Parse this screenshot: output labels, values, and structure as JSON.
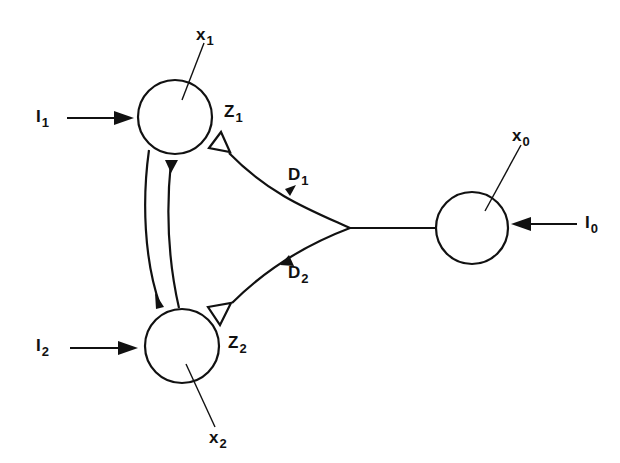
{
  "diagram": {
    "stroke_color": "#111111",
    "background": "#ffffff",
    "nodes": [
      {
        "id": "x1",
        "label": "x",
        "sub": "1",
        "cx": 175,
        "cy": 117,
        "r": 37
      },
      {
        "id": "x2",
        "label": "x",
        "sub": "2",
        "cx": 182,
        "cy": 346,
        "r": 37
      },
      {
        "id": "x0",
        "label": "x",
        "sub": "0",
        "cx": 472,
        "cy": 228,
        "r": 36
      }
    ],
    "inputs": [
      {
        "id": "I1",
        "label": "I",
        "sub": "1",
        "target": "x1"
      },
      {
        "id": "I2",
        "label": "I",
        "sub": "2",
        "target": "x2"
      },
      {
        "id": "I0",
        "label": "I",
        "sub": "0",
        "target": "x0"
      }
    ],
    "synapses": [
      {
        "id": "Z1",
        "label": "Z",
        "sub": "1",
        "type": "open-triangle",
        "target": "x1"
      },
      {
        "id": "Z2",
        "label": "Z",
        "sub": "2",
        "type": "open-triangle",
        "target": "x2"
      }
    ],
    "pathways": [
      {
        "id": "D1",
        "label": "D",
        "sub": "1",
        "from": "x0",
        "to": "x1"
      },
      {
        "id": "D2",
        "label": "D",
        "sub": "2",
        "from": "x0",
        "to": "x2"
      }
    ],
    "mutual_connections": [
      {
        "from": "x2",
        "to": "x1"
      },
      {
        "from": "x1",
        "to": "x2"
      }
    ]
  },
  "labels": {
    "x1": {
      "main": "x",
      "sub": "1"
    },
    "x2": {
      "main": "x",
      "sub": "2"
    },
    "x0": {
      "main": "x",
      "sub": "0"
    },
    "I1": {
      "main": "I",
      "sub": "1"
    },
    "I2": {
      "main": "I",
      "sub": "2"
    },
    "I0": {
      "main": "I",
      "sub": "0"
    },
    "Z1": {
      "main": "Z",
      "sub": "1"
    },
    "Z2": {
      "main": "Z",
      "sub": "2"
    },
    "D1": {
      "main": "D",
      "sub": "1"
    },
    "D2": {
      "main": "D",
      "sub": "2"
    }
  }
}
